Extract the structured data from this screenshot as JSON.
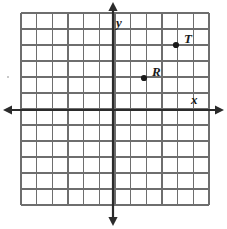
{
  "figure": {
    "kind": "cartesian-coordinate-grid",
    "background_color": "#ffffff",
    "grid_line_color": "#6e6e6e",
    "axis_color": "#2b2b2b",
    "point_color": "#1a1a1a",
    "label_color": "#1a1a1a"
  },
  "grid": {
    "left_px": 21,
    "top_px": 13,
    "right_px": 209,
    "bottom_px": 205,
    "columns": 12,
    "rows": 12,
    "cell_width_px": 15.67,
    "cell_height_px": 16.0
  },
  "axes": {
    "x_axis": {
      "label": "x",
      "label_x_px": 191,
      "label_y_px": 93,
      "y_position_px": 110,
      "start_x_px": 3,
      "end_x_px": 224,
      "arrow_left": true,
      "arrow_right": true
    },
    "y_axis": {
      "label": "y",
      "label_x_px": 116,
      "label_y_px": 16,
      "x_position_px": 113,
      "start_y_px": 2,
      "end_y_px": 226,
      "arrow_up": true,
      "arrow_down": true
    },
    "origin_px": {
      "x": 113,
      "y": 110
    }
  },
  "points": [
    {
      "label": "R",
      "px": {
        "x": 144,
        "y": 78
      },
      "coords": {
        "x": 2,
        "y": 2
      },
      "label_px": {
        "x": 152,
        "y": 65
      },
      "radius_px": 3.1
    },
    {
      "label": "T",
      "px": {
        "x": 176,
        "y": 45
      },
      "coords": {
        "x": 4,
        "y": 4
      },
      "label_px": {
        "x": 184,
        "y": 32
      },
      "radius_px": 3.1
    }
  ],
  "artifacts": [
    {
      "name": "scan-speck-left",
      "x_px": 7,
      "y_px": 76,
      "w_px": 2,
      "h_px": 2
    }
  ]
}
